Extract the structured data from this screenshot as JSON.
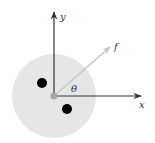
{
  "diagram": {
    "title": "",
    "labels": {
      "y_axis": "y",
      "x_axis": "x",
      "force": "f",
      "angle": "θ"
    },
    "colors": {
      "disk_fill": "#e6e6e6",
      "axis_stroke": "#333333",
      "force_stroke": "#c4c4c4",
      "origin_fill": "#a8a8a8",
      "particle_fill": "#000000",
      "label_color": "#333333"
    },
    "geometry": {
      "origin": [
        54,
        96
      ],
      "disk_radius": 42,
      "x_axis_end": [
        141,
        96
      ],
      "y_axis_end": [
        54,
        12
      ],
      "force_end": [
        110,
        47
      ],
      "particles": [
        {
          "cx": 42,
          "cy": 83,
          "r": 5
        },
        {
          "cx": 67,
          "cy": 109,
          "r": 5
        }
      ]
    }
  }
}
